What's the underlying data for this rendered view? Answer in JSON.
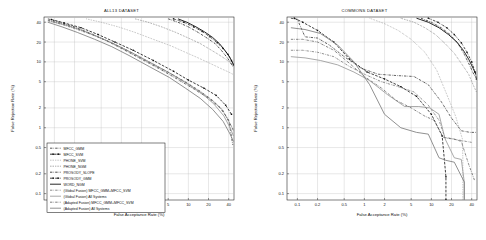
{
  "figure": {
    "background": "#ffffff",
    "panels": [
      {
        "id": "left",
        "title": "ALL13 DATASET",
        "xlabel": "False Acceptance Rate (%)",
        "ylabel": "False Rejection Rate (%)",
        "xticks": [
          "0.1",
          "0.2",
          "0.5",
          "1",
          "2",
          "5",
          "10",
          "20",
          "40"
        ],
        "yticks": [
          "40",
          "20",
          "10",
          "5",
          "2",
          "1",
          "0.5",
          "0.2",
          "0.1"
        ],
        "has_legend": true
      },
      {
        "id": "right",
        "title": "COMMONS DATASET",
        "xlabel": "False Acceptance Rate (%)",
        "ylabel": "False Rejection Rate (%)",
        "xticks": [
          "0.1",
          "0.2",
          "0.5",
          "1",
          "2",
          "5",
          "10",
          "20",
          "40"
        ],
        "yticks": [
          "40",
          "20",
          "10",
          "5",
          "2",
          "1",
          "0.5",
          "0.2",
          "0.1"
        ],
        "has_legend": false
      }
    ]
  },
  "legend": {
    "entries": [
      {
        "label": "MFCC_GMM",
        "style": "dashdot",
        "color": "#3a3a3a",
        "marker": "none"
      },
      {
        "label": "MFCC_SVM",
        "style": "dashed",
        "color": "#111111",
        "marker": "square"
      },
      {
        "label": "PHONE_SVM",
        "style": "dotted",
        "color": "#8a8a8a",
        "marker": "none"
      },
      {
        "label": "PHONE_NGM",
        "style": "dotted",
        "color": "#5a5a5a",
        "marker": "none"
      },
      {
        "label": "PROSODY_SLOPE",
        "style": "dashdot",
        "color": "#2b2b2b",
        "marker": "none"
      },
      {
        "label": "PROSODY_GMM",
        "style": "dashdot",
        "color": "#1d1d1d",
        "marker": "square"
      },
      {
        "label": "WORD_NGM",
        "style": "solid",
        "color": "#000000",
        "marker": "none"
      },
      {
        "label": "(Global Fusion) MFCC_GMM+MFCC_SVM",
        "style": "dashdot",
        "color": "#777777",
        "marker": "none"
      },
      {
        "label": "(Global Fusion) All Systems",
        "style": "solid",
        "color": "#9a9a9a",
        "marker": "none"
      },
      {
        "label": "(Adapted Fusion) MFCC_GMM+MFCC_SVM",
        "style": "dashdot",
        "color": "#666666",
        "marker": "none"
      },
      {
        "label": "(Adapted Fusion) All Systems",
        "style": "solid",
        "color": "#7d7d7d",
        "marker": "none"
      }
    ]
  },
  "chart_data": [
    {
      "type": "line",
      "title": "ALL13 DATASET",
      "xlabel": "False Acceptance Rate (%)",
      "ylabel": "False Rejection Rate (%)",
      "xscale": "det-log",
      "yscale": "det-log",
      "xlim": [
        0.07,
        48
      ],
      "ylim": [
        0.08,
        48
      ],
      "grid": true,
      "legend_position": "lower-left",
      "series": [
        {
          "name": "MFCC_GMM",
          "style": "dashdot",
          "color": "#3a3a3a",
          "x": [
            0.08,
            0.12,
            0.2,
            0.35,
            0.6,
            1.0,
            2.0,
            4.0,
            7.0,
            12.0,
            20.0,
            30.0,
            40.0,
            46.0
          ],
          "y": [
            45.0,
            40.0,
            34.0,
            27.0,
            21.0,
            16.0,
            11.0,
            7.5,
            5.4,
            3.9,
            2.8,
            2.0,
            1.3,
            0.55
          ]
        },
        {
          "name": "MFCC_SVM",
          "style": "dashed",
          "color": "#111111",
          "marker": "square",
          "x": [
            0.09,
            0.14,
            0.25,
            0.45,
            0.8,
            1.5,
            3.0,
            6.0,
            10.0,
            17.0,
            26.0,
            36.0,
            44.0
          ],
          "y": [
            44.0,
            39.0,
            33.0,
            26.0,
            20.0,
            15.0,
            10.5,
            7.2,
            5.3,
            4.0,
            3.1,
            2.2,
            1.6
          ]
        },
        {
          "name": "PHONE_SVM",
          "style": "dotted",
          "color": "#8a8a8a",
          "x": [
            0.3,
            0.5,
            0.9,
            1.6,
            3.0,
            5.5,
            9.0,
            14.0,
            21.0,
            30.0,
            40.0,
            46.0
          ],
          "y": [
            45.0,
            40.0,
            34.0,
            28.0,
            22.0,
            17.5,
            14.0,
            11.5,
            9.5,
            8.0,
            7.0,
            6.5
          ]
        },
        {
          "name": "PHONE_NGM",
          "style": "dotted",
          "color": "#5a5a5a",
          "x": [
            1.6,
            2.5,
            4.0,
            6.5,
            10.0,
            15.0,
            21.0,
            28.0,
            36.0,
            43.0,
            47.0
          ],
          "y": [
            45.0,
            40.0,
            34.0,
            28.0,
            23.0,
            19.0,
            15.5,
            13.0,
            11.0,
            9.5,
            8.8
          ]
        },
        {
          "name": "PROSODY_SLOPE",
          "style": "dashdot",
          "color": "#2b2b2b",
          "x": [
            5.0,
            7.0,
            10.0,
            14.0,
            19.0,
            25.0,
            31.0,
            37.0,
            42.0,
            46.0
          ],
          "y": [
            45.0,
            40.0,
            34.0,
            28.0,
            23.0,
            19.0,
            15.0,
            12.0,
            10.0,
            8.5
          ]
        },
        {
          "name": "PROSODY_GMM",
          "style": "dashdot",
          "color": "#1d1d1d",
          "marker": "square",
          "x": [
            6.0,
            8.5,
            12.0,
            16.0,
            21.0,
            27.0,
            33.0,
            39.0,
            44.0,
            47.0
          ],
          "y": [
            45.0,
            40.0,
            34.0,
            29.0,
            24.0,
            19.5,
            16.0,
            13.0,
            10.5,
            9.0
          ]
        },
        {
          "name": "WORD_NGM",
          "style": "solid",
          "color": "#000000",
          "x": [
            7.0,
            9.5,
            13.0,
            17.5,
            23.0,
            29.0,
            35.0,
            41.0,
            45.0,
            47.0
          ],
          "y": [
            45.0,
            40.0,
            34.0,
            28.5,
            23.5,
            19.0,
            15.0,
            12.0,
            10.0,
            9.2
          ]
        },
        {
          "name": "(Global Fusion) MFCC_GMM+MFCC_SVM",
          "style": "dashdot",
          "color": "#777777",
          "x": [
            0.08,
            0.13,
            0.22,
            0.4,
            0.7,
            1.3,
            2.6,
            5.0,
            9.0,
            15.0,
            23.0,
            33.0,
            42.0,
            47.0
          ],
          "y": [
            42.0,
            37.0,
            31.0,
            25.0,
            19.5,
            14.5,
            10.0,
            7.0,
            5.0,
            3.6,
            2.6,
            1.8,
            1.15,
            0.9
          ]
        },
        {
          "name": "(Global Fusion) All Systems",
          "style": "solid",
          "color": "#9a9a9a",
          "x": [
            0.09,
            0.15,
            0.26,
            0.45,
            0.8,
            1.4,
            2.8,
            5.5,
            9.5,
            16.0,
            24.0,
            34.0,
            43.0,
            47.0
          ],
          "y": [
            41.0,
            36.0,
            30.0,
            24.0,
            18.5,
            14.0,
            9.6,
            6.6,
            4.7,
            3.3,
            2.3,
            1.5,
            0.95,
            0.75
          ]
        },
        {
          "name": "(Adapted Fusion) MFCC_GMM+MFCC_SVM",
          "style": "dashdot",
          "color": "#666666",
          "x": [
            0.08,
            0.13,
            0.22,
            0.38,
            0.68,
            1.2,
            2.4,
            4.8,
            8.5,
            14.0,
            22.0,
            32.0,
            41.0,
            46.5
          ],
          "y": [
            43.0,
            38.0,
            32.0,
            25.5,
            20.0,
            15.0,
            10.2,
            7.1,
            5.1,
            3.7,
            2.7,
            1.9,
            1.2,
            0.95
          ]
        },
        {
          "name": "(Adapted Fusion) All Systems",
          "style": "solid",
          "color": "#7d7d7d",
          "x": [
            0.08,
            0.13,
            0.22,
            0.4,
            0.72,
            1.3,
            2.6,
            5.2,
            9.0,
            15.0,
            23.0,
            33.0,
            42.0,
            47.0
          ],
          "y": [
            40.0,
            34.0,
            28.0,
            22.0,
            17.0,
            12.5,
            8.5,
            5.8,
            4.0,
            2.8,
            1.9,
            1.25,
            0.8,
            0.62
          ]
        }
      ]
    },
    {
      "type": "line",
      "title": "COMMONS DATASET",
      "xlabel": "False Acceptance Rate (%)",
      "ylabel": "False Rejection Rate (%)",
      "xscale": "det-log",
      "yscale": "det-log",
      "xlim": [
        0.07,
        48
      ],
      "ylim": [
        0.08,
        48
      ],
      "grid": true,
      "legend_position": "none",
      "series": [
        {
          "name": "MFCC_GMM",
          "style": "dashdot",
          "color": "#3a3a3a",
          "x": [
            0.08,
            0.1,
            0.13,
            0.2,
            0.3,
            0.5,
            0.9,
            1.6,
            3.0,
            5.5,
            9.0,
            14.0,
            20.0,
            28.0,
            38.0,
            46.0
          ],
          "y": [
            46.0,
            44.0,
            24.0,
            23.0,
            18.0,
            12.0,
            8.0,
            6.5,
            6.2,
            6.0,
            4.5,
            2.5,
            1.4,
            0.9,
            0.85,
            0.85
          ]
        },
        {
          "name": "MFCC_SVM",
          "style": "dashed",
          "color": "#111111",
          "marker": "square",
          "x": [
            0.09,
            0.12,
            0.2,
            0.35,
            0.6,
            1.1,
            2.0,
            3.5,
            6.0,
            10.0,
            14.5,
            16.5,
            16.5
          ],
          "y": [
            46.0,
            40.0,
            30.0,
            20.0,
            11.0,
            7.0,
            5.5,
            4.2,
            3.0,
            1.6,
            0.75,
            0.18,
            0.08
          ]
        },
        {
          "name": "PHONE_SVM",
          "style": "dotted",
          "color": "#8a8a8a",
          "x": [
            1.2,
            2.0,
            3.2,
            5.0,
            8.0,
            12.0,
            17.0,
            23.0,
            29.0,
            29.5,
            29.5
          ],
          "y": [
            46.0,
            38.0,
            30.0,
            22.0,
            14.0,
            7.5,
            3.2,
            1.5,
            0.68,
            0.35,
            0.08
          ]
        },
        {
          "name": "PHONE_NGM",
          "style": "dotted",
          "color": "#5a5a5a",
          "x": [
            3.5,
            5.5,
            8.0,
            11.5,
            16.0,
            22.0,
            29.0,
            36.0,
            42.0,
            47.0
          ],
          "y": [
            46.0,
            40.0,
            33.0,
            26.0,
            19.0,
            13.5,
            9.0,
            6.5,
            4.5,
            3.5
          ]
        },
        {
          "name": "PROSODY_SLOPE",
          "style": "dashdot",
          "color": "#2b2b2b",
          "x": [
            7.0,
            10.0,
            14.0,
            19.0,
            25.0,
            31.0,
            37.0,
            42.0,
            46.0
          ],
          "y": [
            46.0,
            40.0,
            33.0,
            26.0,
            19.0,
            13.0,
            9.0,
            6.8,
            5.8
          ]
        },
        {
          "name": "PROSODY_GMM",
          "style": "dashdot",
          "color": "#1d1d1d",
          "marker": "square",
          "x": [
            9.0,
            12.5,
            17.0,
            22.0,
            28.0,
            34.0,
            40.0,
            45.0,
            47.0
          ],
          "y": [
            46.0,
            40.0,
            33.0,
            26.0,
            19.5,
            14.0,
            10.0,
            7.0,
            5.5
          ]
        },
        {
          "name": "WORD_NGM",
          "style": "solid",
          "color": "#000000",
          "x": [
            6.0,
            9.0,
            13.0,
            18.0,
            24.0,
            30.0,
            36.0,
            42.0,
            46.0
          ],
          "y": [
            46.0,
            40.0,
            33.0,
            26.0,
            20.0,
            15.0,
            11.0,
            8.0,
            6.5
          ]
        },
        {
          "name": "(Global Fusion) MFCC_GMM+MFCC_SVM",
          "style": "dashdot",
          "color": "#777777",
          "x": [
            0.08,
            0.12,
            0.2,
            0.35,
            0.6,
            1.0,
            1.8,
            3.2,
            5.5,
            9.0,
            13.0,
            16.0,
            20.0,
            26.0,
            33.0,
            40.0
          ],
          "y": [
            15.0,
            15.0,
            14.0,
            12.0,
            8.5,
            6.5,
            5.0,
            4.2,
            3.5,
            2.2,
            1.3,
            0.7,
            0.68,
            0.65,
            0.62,
            0.6
          ]
        },
        {
          "name": "(Global Fusion) All Systems",
          "style": "solid",
          "color": "#9a9a9a",
          "x": [
            0.08,
            0.13,
            0.22,
            0.4,
            0.7,
            1.2,
            2.2,
            4.0,
            6.5,
            9.5,
            13.0,
            16.0,
            22.0,
            28.0,
            31.0,
            31.0
          ],
          "y": [
            12.0,
            11.5,
            10.5,
            9.0,
            7.0,
            5.2,
            3.2,
            2.1,
            2.1,
            2.0,
            1.6,
            0.68,
            0.35,
            0.33,
            0.15,
            0.08
          ]
        },
        {
          "name": "(Adapted Fusion) MFCC_GMM+MFCC_SVM",
          "style": "dashdot",
          "color": "#666666",
          "x": [
            0.08,
            0.12,
            0.2,
            0.35,
            0.6,
            1.0,
            1.8,
            3.0,
            5.0,
            8.0,
            11.0,
            15.0,
            21.0,
            28.0,
            36.0,
            44.0
          ],
          "y": [
            22.0,
            22.0,
            20.0,
            15.0,
            9.5,
            6.0,
            4.0,
            2.6,
            2.0,
            1.5,
            1.3,
            0.72,
            0.68,
            0.62,
            0.28,
            0.16
          ]
        },
        {
          "name": "(Adapted Fusion) All Systems",
          "style": "solid",
          "color": "#7d7d7d",
          "x": [
            0.08,
            0.13,
            0.22,
            0.4,
            0.7,
            1.2,
            2.0,
            3.5,
            6.0,
            9.0,
            13.0,
            16.5,
            22.0,
            31.0,
            31.0
          ],
          "y": [
            33.0,
            31.0,
            27.0,
            18.0,
            10.0,
            4.5,
            1.6,
            1.0,
            0.85,
            0.8,
            0.35,
            0.32,
            0.3,
            0.15,
            0.08
          ]
        }
      ]
    }
  ]
}
